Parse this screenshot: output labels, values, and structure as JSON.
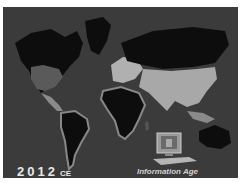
{
  "map": {
    "year": "2012",
    "era": "CE",
    "caption": "Information Age",
    "icon": "computer-icon",
    "colors": {
      "ocean": "#3b3b3b",
      "land_dark": "#0d0d0d",
      "land_light": "#a8a8a8",
      "text": "#e8e8e8"
    }
  }
}
